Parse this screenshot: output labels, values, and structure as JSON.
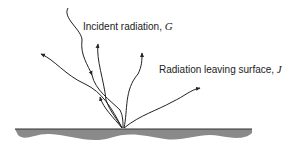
{
  "diagram": {
    "incident_label": "Incident radiation, ",
    "incident_symbol": "G",
    "leaving_label": "Radiation leaving surface, ",
    "leaving_symbol": "J",
    "colors": {
      "line": "#222222",
      "surface": "#8a8a8a",
      "surface_edge": "#333333"
    }
  }
}
